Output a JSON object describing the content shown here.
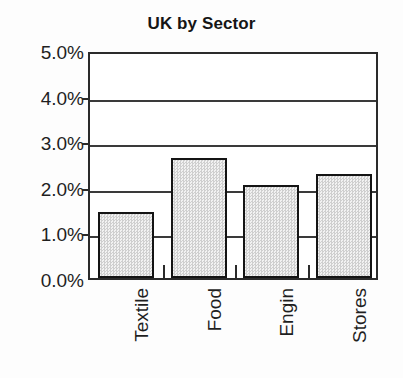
{
  "chart_data": {
    "type": "bar",
    "title": "UK by Sector",
    "xlabel": "",
    "ylabel": "",
    "categories": [
      "Textile",
      "Food",
      "Engin",
      "Stores"
    ],
    "values": [
      1.45,
      2.63,
      2.04,
      2.28
    ],
    "value_unit": "%",
    "ylim": [
      0.0,
      5.0
    ],
    "ytick_values": [
      5.0,
      4.0,
      3.0,
      2.0,
      1.0,
      0.0
    ],
    "ytick_labels": [
      "5.0%",
      "4.0%",
      "3.0%",
      "2.0%",
      "1.0%",
      "0.0%"
    ],
    "grid": true,
    "grid_axis": "y",
    "legend": false,
    "legend_position": "none",
    "bar_fill": "#dcdcdc",
    "bar_edge": "#141414",
    "axis_color": "#2b2b2b",
    "background": "#ffffff",
    "x_tick_marks_between_bars": true,
    "category_label_rotation": -90
  }
}
